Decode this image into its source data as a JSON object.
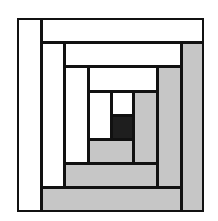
{
  "diagram": {
    "type": "log-cabin-quilt-block",
    "colors": {
      "light": "#ffffff",
      "medium": "#c6c6c6",
      "dark": "#1e1e1e",
      "line": "#111111"
    },
    "pieces": [
      {
        "name": "center-square",
        "x": 111,
        "y": 115,
        "w": 23,
        "h": 25,
        "fill": "dark"
      },
      {
        "name": "round1-top-light",
        "x": 111,
        "y": 91,
        "w": 23,
        "h": 25,
        "fill": "light"
      },
      {
        "name": "round1-left-light",
        "x": 88,
        "y": 91,
        "w": 24,
        "h": 49,
        "fill": "light"
      },
      {
        "name": "round1-bottom-medium",
        "x": 88,
        "y": 139,
        "w": 46,
        "h": 25,
        "fill": "medium"
      },
      {
        "name": "round1-right-medium",
        "x": 133,
        "y": 91,
        "w": 25,
        "h": 73,
        "fill": "medium"
      },
      {
        "name": "round2-top-light",
        "x": 88,
        "y": 66,
        "w": 70,
        "h": 26,
        "fill": "light"
      },
      {
        "name": "round2-left-light",
        "x": 64,
        "y": 66,
        "w": 25,
        "h": 98,
        "fill": "light"
      },
      {
        "name": "round2-bottom-medium",
        "x": 64,
        "y": 163,
        "w": 94,
        "h": 25,
        "fill": "medium"
      },
      {
        "name": "round2-right-medium",
        "x": 157,
        "y": 66,
        "w": 25,
        "h": 122,
        "fill": "medium"
      },
      {
        "name": "round3-top-light",
        "x": 64,
        "y": 42,
        "w": 118,
        "h": 25,
        "fill": "light"
      },
      {
        "name": "round3-left-light",
        "x": 41,
        "y": 42,
        "w": 24,
        "h": 146,
        "fill": "light"
      },
      {
        "name": "round3-bottom-medium",
        "x": 41,
        "y": 187,
        "w": 141,
        "h": 25,
        "fill": "medium"
      },
      {
        "name": "round3-right-medium",
        "x": 181,
        "y": 42,
        "w": 23,
        "h": 170,
        "fill": "medium"
      },
      {
        "name": "round4-top-light",
        "x": 41,
        "y": 18,
        "w": 163,
        "h": 25,
        "fill": "light"
      },
      {
        "name": "round4-left-light",
        "x": 17,
        "y": 18,
        "w": 25,
        "h": 194,
        "fill": "light"
      }
    ]
  }
}
